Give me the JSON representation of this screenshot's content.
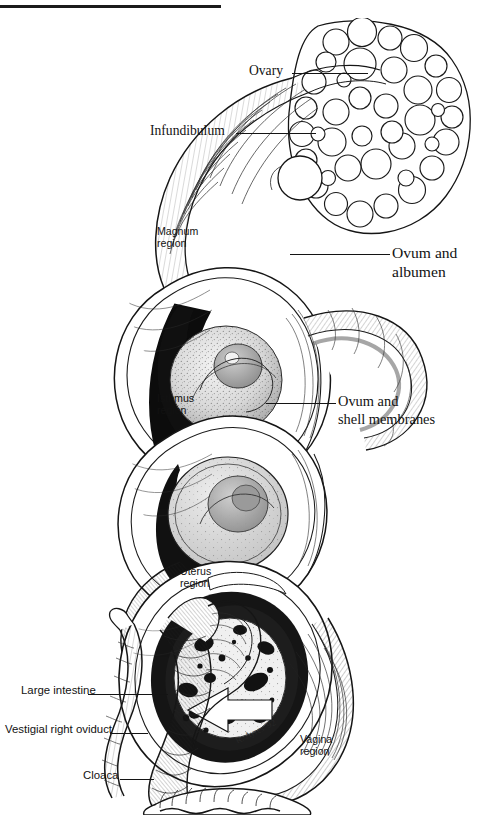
{
  "page": {
    "top_rule": true
  },
  "text_column": {
    "paragraphs": [
      {
        "heading": "minutes",
        "body": "y and immedi-\n(or infundibu-\nduct. Over the\nary action into"
      },
      {
        "heading": "",
        "body": "res a coating of\nr period."
      },
      {
        "heading": "",
        "body": "ating pass into\nmembranes are\nut an hour the\ne oviduct into\nof the oviduct."
      },
      {
        "heading": "",
        "body": "uter shell and,\natation. As the\non it may twist\nam). Pigment-\ne eggshell as it\nisual record of\npid movement\nks on the egg\nh round spots,\ns about twenty\nhe hard outer\ngh the vagina\na and is imme-"
      }
    ]
  },
  "illustration": {
    "title": "hen-reproductive-tract-diagram",
    "artist_signature": "R. Ayres '92",
    "labels": {
      "ovary": "Ovary",
      "infundibulum": "Infundibulum",
      "ovum_and_albumen": "Ovum and\nalbumen",
      "ovum_and_shell_membranes": "Ovum and\nshell  membranes",
      "magnum_region": "Magnum\nregion",
      "isthmus_region": "Isthmus\nregion",
      "uterus_region": "Uterus\nregion",
      "vagina_region": "Vagina\nregion",
      "large_intestine": "Large intestine",
      "vestigial_right_oviduct": "Vestigial right oviduct",
      "cloaca": "Cloaca"
    }
  },
  "colors": {
    "ink": "#141414",
    "paper": "#ffffff",
    "shadow": "#2b2b2b"
  }
}
